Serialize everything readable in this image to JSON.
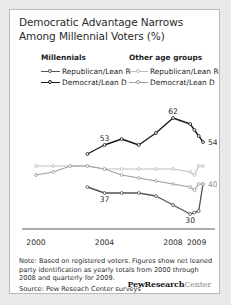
{
  "title": "Democratic Advantage Narrows Among Millennial Voters (%)",
  "legend": {
    "groups": [
      {
        "heading": "Millennials",
        "items": [
          {
            "label": "Republican/Lean R",
            "color": "#555555"
          },
          {
            "label": "Democrat/Lean D",
            "color": "#1a1a1a"
          }
        ]
      },
      {
        "heading": "Other age groups",
        "items": [
          {
            "label": "Republican/Lean R",
            "color": "#bdbdbd"
          },
          {
            "label": "Democrat/Lean D",
            "color": "#9e9e9e"
          }
        ]
      }
    ]
  },
  "note": "Note: Based on registered voters. Figures show net leaned party identification as yearly totals from 2000 through 2008 and quarterly for 2009.",
  "source": "Source: Pew Reseach Center surveys",
  "logo": {
    "bold": "PewResearch",
    "light": "Center"
  },
  "chart_data": {
    "type": "line",
    "title": "Democratic Advantage Narrows Among Millennial Voters (%)",
    "xlabel": "",
    "ylabel": "",
    "grid": false,
    "legend_position": "top",
    "xlim": [
      2000,
      2009.75
    ],
    "ylim": [
      26,
      66
    ],
    "x": [
      2000,
      2001,
      2002,
      2003,
      2004,
      2005,
      2006,
      2007,
      2008,
      2009.0,
      2009.25,
      2009.5,
      2009.75
    ],
    "xtick_labels": [
      "2000",
      "2004",
      "2008",
      "2009"
    ],
    "xtick_values": [
      2000,
      2004,
      2008,
      2009.375
    ],
    "series": [
      {
        "name": "Millennials Democrat/Lean D",
        "color": "#1a1a1a",
        "values": [
          null,
          null,
          null,
          50,
          53,
          55,
          53,
          57,
          62,
          60,
          58,
          56,
          54
        ],
        "point_labels": [
          {
            "x": 2004,
            "value": 53,
            "text": "53"
          },
          {
            "x": 2008,
            "value": 62,
            "text": "62"
          },
          {
            "x": 2009.75,
            "value": 54,
            "text": "54"
          }
        ]
      },
      {
        "name": "Millennials Republican/Lean R",
        "color": "#555555",
        "values": [
          null,
          null,
          null,
          39,
          37,
          37,
          37,
          36,
          33,
          30,
          30.5,
          31,
          40
        ],
        "point_labels": [
          {
            "x": 2004,
            "value": 37,
            "text": "37"
          },
          {
            "x": 2009.0,
            "value": 30,
            "text": "30"
          }
        ]
      },
      {
        "name": "Other age groups Republican/Lean R",
        "color": "#bdbdbd",
        "values": [
          46,
          46,
          46,
          46,
          45,
          45,
          45,
          45,
          45,
          44,
          43,
          46,
          46
        ],
        "point_labels": []
      },
      {
        "name": "Other age groups Democrat/Lean D",
        "color": "#9e9e9e",
        "values": [
          43,
          44,
          46,
          46,
          45,
          43,
          42,
          41,
          40,
          39,
          38,
          40,
          40
        ],
        "point_labels": [
          {
            "x": 2009.75,
            "value": 40,
            "text": "40"
          }
        ]
      }
    ]
  }
}
